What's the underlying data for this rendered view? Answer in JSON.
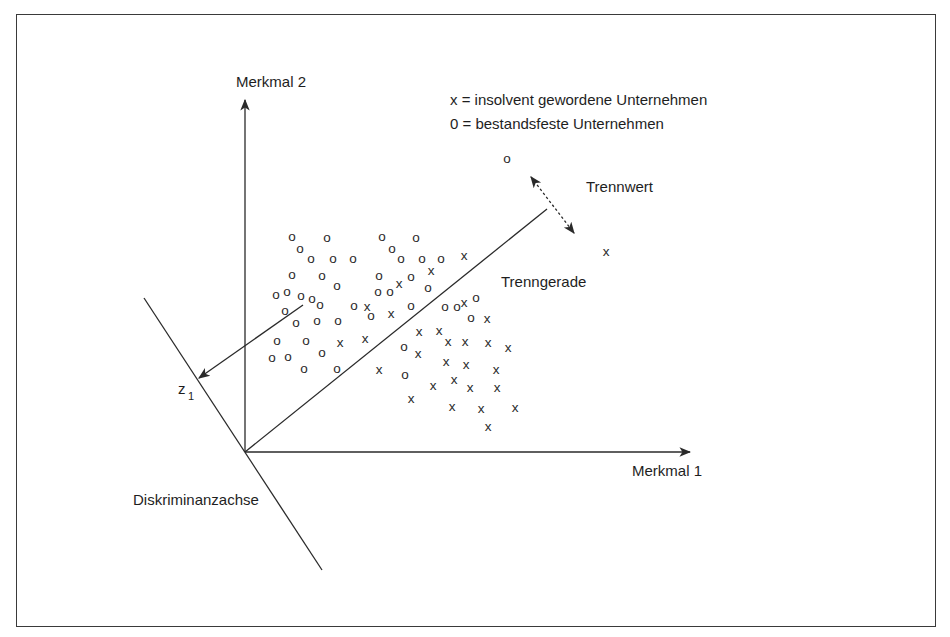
{
  "diagram": {
    "axes": {
      "y_label": "Merkmal 2",
      "x_label": "Merkmal 1",
      "discriminant_axis_label": "Diskriminanzachse",
      "projection_label": "z",
      "projection_subscript": "1"
    },
    "legend": {
      "line1": "x = insolvent gewordene Unternehmen",
      "line2": "0 = bestandsfeste Unternehmen"
    },
    "annotations": {
      "cutoff_label": "Trennwert",
      "separating_line_label": "Trenngerade"
    },
    "symbols": {
      "solvent": "o",
      "insolvent": "x"
    },
    "colors": {
      "ink": "#2a2a2a",
      "frame": "#3a3a3a",
      "background": "#ffffff"
    },
    "points": [
      {
        "t": "o",
        "x": 292,
        "y": 236
      },
      {
        "t": "o",
        "x": 327,
        "y": 237
      },
      {
        "t": "o",
        "x": 300,
        "y": 248
      },
      {
        "t": "o",
        "x": 311,
        "y": 258
      },
      {
        "t": "o",
        "x": 333,
        "y": 258
      },
      {
        "t": "o",
        "x": 353,
        "y": 258
      },
      {
        "t": "o",
        "x": 292,
        "y": 274
      },
      {
        "t": "o",
        "x": 322,
        "y": 275
      },
      {
        "t": "o",
        "x": 337,
        "y": 285
      },
      {
        "t": "o",
        "x": 276,
        "y": 294
      },
      {
        "t": "o",
        "x": 287,
        "y": 291
      },
      {
        "t": "o",
        "x": 301,
        "y": 295
      },
      {
        "t": "o",
        "x": 312,
        "y": 298
      },
      {
        "t": "o",
        "x": 320,
        "y": 304
      },
      {
        "t": "o",
        "x": 285,
        "y": 310
      },
      {
        "t": "o",
        "x": 296,
        "y": 322
      },
      {
        "t": "o",
        "x": 317,
        "y": 320
      },
      {
        "t": "o",
        "x": 338,
        "y": 320
      },
      {
        "t": "o",
        "x": 354,
        "y": 305
      },
      {
        "t": "x",
        "x": 367,
        "y": 306
      },
      {
        "t": "o",
        "x": 371,
        "y": 315
      },
      {
        "t": "o",
        "x": 277,
        "y": 340
      },
      {
        "t": "o",
        "x": 306,
        "y": 340
      },
      {
        "t": "x",
        "x": 340,
        "y": 342
      },
      {
        "t": "x",
        "x": 365,
        "y": 338
      },
      {
        "t": "o",
        "x": 272,
        "y": 357
      },
      {
        "t": "o",
        "x": 288,
        "y": 356
      },
      {
        "t": "o",
        "x": 322,
        "y": 352
      },
      {
        "t": "o",
        "x": 304,
        "y": 368
      },
      {
        "t": "o",
        "x": 337,
        "y": 368
      },
      {
        "t": "o",
        "x": 382,
        "y": 236
      },
      {
        "t": "o",
        "x": 416,
        "y": 237
      },
      {
        "t": "o",
        "x": 392,
        "y": 248
      },
      {
        "t": "o",
        "x": 401,
        "y": 258
      },
      {
        "t": "o",
        "x": 422,
        "y": 258
      },
      {
        "t": "o",
        "x": 441,
        "y": 258
      },
      {
        "t": "x",
        "x": 464,
        "y": 255
      },
      {
        "t": "o",
        "x": 379,
        "y": 275
      },
      {
        "t": "x",
        "x": 399,
        "y": 283
      },
      {
        "t": "o",
        "x": 411,
        "y": 276
      },
      {
        "t": "x",
        "x": 431,
        "y": 270
      },
      {
        "t": "o",
        "x": 378,
        "y": 291
      },
      {
        "t": "o",
        "x": 390,
        "y": 291
      },
      {
        "t": "o",
        "x": 428,
        "y": 287
      },
      {
        "t": "x",
        "x": 391,
        "y": 313
      },
      {
        "t": "o",
        "x": 411,
        "y": 305
      },
      {
        "t": "o",
        "x": 445,
        "y": 306
      },
      {
        "t": "o",
        "x": 457,
        "y": 306
      },
      {
        "t": "o",
        "x": 476,
        "y": 297
      },
      {
        "t": "o",
        "x": 471,
        "y": 317
      },
      {
        "t": "x",
        "x": 487,
        "y": 318
      },
      {
        "t": "x",
        "x": 464,
        "y": 302
      },
      {
        "t": "x",
        "x": 379,
        "y": 369
      },
      {
        "t": "x",
        "x": 419,
        "y": 331
      },
      {
        "t": "x",
        "x": 439,
        "y": 330
      },
      {
        "t": "o",
        "x": 404,
        "y": 346
      },
      {
        "t": "x",
        "x": 418,
        "y": 353
      },
      {
        "t": "x",
        "x": 448,
        "y": 341
      },
      {
        "t": "x",
        "x": 465,
        "y": 341
      },
      {
        "t": "x",
        "x": 488,
        "y": 342
      },
      {
        "t": "x",
        "x": 508,
        "y": 347
      },
      {
        "t": "x",
        "x": 446,
        "y": 361
      },
      {
        "t": "x",
        "x": 466,
        "y": 364
      },
      {
        "t": "x",
        "x": 496,
        "y": 369
      },
      {
        "t": "o",
        "x": 405,
        "y": 374
      },
      {
        "t": "x",
        "x": 433,
        "y": 385
      },
      {
        "t": "x",
        "x": 454,
        "y": 379
      },
      {
        "t": "x",
        "x": 470,
        "y": 387
      },
      {
        "t": "x",
        "x": 497,
        "y": 387
      },
      {
        "t": "x",
        "x": 411,
        "y": 398
      },
      {
        "t": "x",
        "x": 452,
        "y": 406
      },
      {
        "t": "x",
        "x": 481,
        "y": 408
      },
      {
        "t": "x",
        "x": 515,
        "y": 407
      },
      {
        "t": "x",
        "x": 488,
        "y": 426
      },
      {
        "t": "o",
        "x": 507,
        "y": 158
      },
      {
        "t": "x",
        "x": 606,
        "y": 251
      }
    ]
  }
}
